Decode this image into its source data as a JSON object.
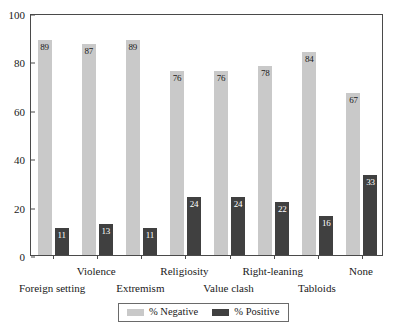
{
  "chart_data": {
    "type": "bar",
    "title": "",
    "subtitle": "",
    "xlabel": "",
    "ylabel": "",
    "ylim": [
      0,
      100
    ],
    "yticks": [
      0,
      20,
      40,
      60,
      80,
      100
    ],
    "grid": false,
    "legend_position": "bottom",
    "categories": [
      "Foreign setting",
      "Violence",
      "Extremism",
      "Religiosity",
      "Value clash",
      "Right-leaning",
      "Tabloids",
      "None"
    ],
    "series": [
      {
        "name": "% Negative",
        "color": "#c9c9c9",
        "values": [
          89,
          87,
          89,
          76,
          76,
          78,
          84,
          67
        ]
      },
      {
        "name": "% Positive",
        "color": "#404040",
        "values": [
          11,
          13,
          11,
          24,
          24,
          22,
          16,
          33
        ]
      }
    ]
  },
  "legend": {
    "items": [
      {
        "label": "% Negative",
        "swatch": "neg"
      },
      {
        "label": "% Positive",
        "swatch": "pos"
      }
    ]
  },
  "axis": {
    "y_tick_labels": [
      "0",
      "20",
      "40",
      "60",
      "80",
      "100"
    ]
  }
}
